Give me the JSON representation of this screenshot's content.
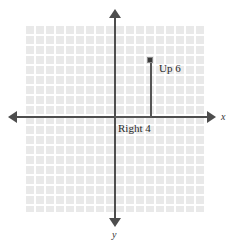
{
  "figure": {
    "name": "coordinate-plane-graph",
    "background_color": "#ffffff",
    "grid": {
      "color": "#e6e6e6",
      "line_color": "#ffffff",
      "cell_size_px": 10,
      "columns": 18,
      "rows": 19
    },
    "axes": {
      "color": "#4d4d4d",
      "x_label": "x",
      "y_label": "y",
      "origin_px": {
        "x": 115,
        "y": 117
      },
      "arrowheads": [
        "left",
        "right",
        "up",
        "down"
      ]
    },
    "annotations": {
      "horizontal_move_label": "Right 4",
      "vertical_move_label": "Up 6"
    },
    "point": {
      "label": "",
      "color": "#3a3a3a",
      "position_px": {
        "x": 151,
        "y": 60
      }
    }
  },
  "chart_data": {
    "type": "scatter",
    "title": "",
    "subtitle": "",
    "xlabel": "x",
    "ylabel": "y",
    "grid": true,
    "legend": "none",
    "xlim": [
      -9,
      9
    ],
    "ylim": [
      -9.5,
      9.5
    ],
    "unit_px": 9,
    "points": [
      {
        "x": 4,
        "y": 6,
        "label": ""
      }
    ],
    "path": {
      "from": [
        0,
        0
      ],
      "steps": [
        {
          "direction": "right",
          "amount": 4,
          "label": "Right 4",
          "to": [
            4,
            0
          ]
        },
        {
          "direction": "up",
          "amount": 6,
          "label": "Up 6",
          "to": [
            4,
            6
          ]
        }
      ]
    },
    "annotations": [
      {
        "text": "Right 4",
        "x": 1.8,
        "y": -1.3
      },
      {
        "text": "Up 6",
        "x": 5.2,
        "y": 3.4
      }
    ],
    "tick_labels": {
      "x": [],
      "y": []
    }
  }
}
